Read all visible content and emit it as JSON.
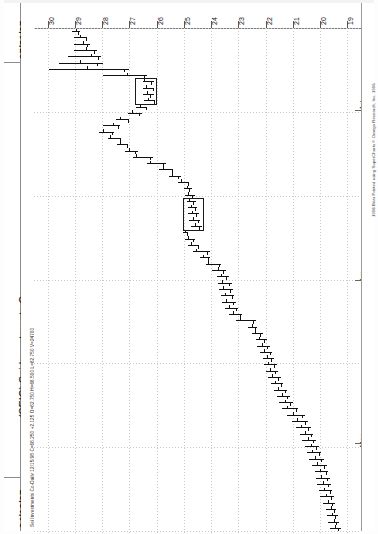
{
  "header": {
    "date_top": "07/31/97",
    "date_bottom": "04/16/97",
    "title": "(SEIC) Sei Investments Co",
    "quote_line": "Sei Investments Co-Daily  12/15/98  C=66.250  +2.125  O=62.750  H=66.500  L=62.750  V=24700",
    "copyright": "1998 Bear  Printed using SuperCharts © Omega Research, Inc. 1996"
  },
  "chart_data": {
    "type": "bar",
    "subtype": "ohlc-bar-chart-rotated",
    "title": "(SEIC) Sei Investments Co",
    "xlabel": "Date",
    "ylabel": "Price",
    "orientation": "rotated-90",
    "grid": true,
    "price_ticks": [
      30,
      29,
      28,
      27,
      26,
      25,
      24,
      23,
      22,
      21,
      20,
      19
    ],
    "ylim": [
      18.5,
      30.5
    ],
    "date_range": [
      "04/16/97",
      "07/31/97"
    ],
    "month_labels": [
      "Jul",
      "Jun",
      "May"
    ],
    "legend": [],
    "series": [
      {
        "name": "SEIC Daily OHLC",
        "bars": [
          {
            "t": 0,
            "o": 28.95,
            "h": 29.1,
            "l": 28.8,
            "c": 28.9
          },
          {
            "t": 1,
            "o": 28.8,
            "h": 29.05,
            "l": 28.55,
            "c": 28.6
          },
          {
            "t": 2,
            "o": 28.7,
            "h": 29.05,
            "l": 28.45,
            "c": 28.55
          },
          {
            "t": 3,
            "o": 28.6,
            "h": 29.05,
            "l": 28.2,
            "c": 28.3
          },
          {
            "t": 4,
            "o": 28.4,
            "h": 29.25,
            "l": 28.05,
            "c": 28.15
          },
          {
            "t": 5,
            "o": 28.8,
            "h": 29.6,
            "l": 27.95,
            "c": 28.2
          },
          {
            "t": 6,
            "o": 28.55,
            "h": 29.95,
            "l": 27.0,
            "c": 27.2
          },
          {
            "t": 7,
            "o": 27.1,
            "h": 27.95,
            "l": 26.35,
            "c": 26.45
          },
          {
            "t": 8,
            "o": 26.45,
            "h": 26.5,
            "l": 26.1,
            "c": 26.2
          },
          {
            "t": 9,
            "o": 26.4,
            "h": 26.5,
            "l": 26.1,
            "c": 26.15
          },
          {
            "t": 10,
            "o": 26.35,
            "h": 26.5,
            "l": 26.1,
            "c": 26.25
          },
          {
            "t": 11,
            "o": 26.3,
            "h": 26.45,
            "l": 26.05,
            "c": 26.1
          },
          {
            "t": 12,
            "o": 26.6,
            "h": 26.75,
            "l": 26.35,
            "c": 26.4
          },
          {
            "t": 13,
            "o": 26.9,
            "h": 27.05,
            "l": 26.55,
            "c": 26.65
          },
          {
            "t": 14,
            "o": 27.35,
            "h": 27.5,
            "l": 27.0,
            "c": 27.05
          },
          {
            "t": 15,
            "o": 27.6,
            "h": 27.95,
            "l": 27.35,
            "c": 27.4
          },
          {
            "t": 16,
            "o": 27.95,
            "h": 28.1,
            "l": 27.55,
            "c": 27.65
          },
          {
            "t": 17,
            "o": 27.7,
            "h": 27.8,
            "l": 27.3,
            "c": 27.35
          },
          {
            "t": 18,
            "o": 27.35,
            "h": 27.45,
            "l": 27.05,
            "c": 27.1
          },
          {
            "t": 19,
            "o": 27.0,
            "h": 27.15,
            "l": 26.7,
            "c": 26.8
          },
          {
            "t": 20,
            "o": 26.75,
            "h": 26.85,
            "l": 26.15,
            "c": 26.25
          },
          {
            "t": 21,
            "o": 26.25,
            "h": 26.35,
            "l": 25.65,
            "c": 25.75
          },
          {
            "t": 22,
            "o": 25.75,
            "h": 25.9,
            "l": 25.4,
            "c": 25.45
          },
          {
            "t": 23,
            "o": 25.45,
            "h": 25.55,
            "l": 25.1,
            "c": 25.2
          },
          {
            "t": 24,
            "o": 25.1,
            "h": 25.2,
            "l": 24.8,
            "c": 24.85
          },
          {
            "t": 25,
            "o": 24.9,
            "h": 25.0,
            "l": 24.7,
            "c": 24.8
          },
          {
            "t": 26,
            "o": 24.85,
            "h": 24.95,
            "l": 24.6,
            "c": 24.7
          },
          {
            "t": 27,
            "o": 24.8,
            "h": 24.9,
            "l": 24.55,
            "c": 24.65
          },
          {
            "t": 28,
            "o": 24.75,
            "h": 24.85,
            "l": 24.5,
            "c": 24.6
          },
          {
            "t": 29,
            "o": 24.7,
            "h": 24.85,
            "l": 24.45,
            "c": 24.55
          },
          {
            "t": 30,
            "o": 24.65,
            "h": 24.8,
            "l": 24.4,
            "c": 24.5
          },
          {
            "t": 31,
            "o": 24.6,
            "h": 24.75,
            "l": 24.35,
            "c": 24.45
          },
          {
            "t": 32,
            "o": 24.95,
            "h": 25.05,
            "l": 24.85,
            "c": 24.9
          },
          {
            "t": 33,
            "o": 24.85,
            "h": 24.95,
            "l": 24.6,
            "c": 24.65
          },
          {
            "t": 34,
            "o": 24.75,
            "h": 24.85,
            "l": 24.45,
            "c": 24.5
          },
          {
            "t": 35,
            "o": 24.55,
            "h": 24.65,
            "l": 24.05,
            "c": 24.15
          },
          {
            "t": 36,
            "o": 24.3,
            "h": 24.4,
            "l": 24.05,
            "c": 24.1
          },
          {
            "t": 37,
            "o": 24.1,
            "h": 24.2,
            "l": 23.65,
            "c": 23.7
          },
          {
            "t": 38,
            "o": 23.75,
            "h": 23.95,
            "l": 23.45,
            "c": 23.55
          },
          {
            "t": 39,
            "o": 23.65,
            "h": 23.8,
            "l": 23.35,
            "c": 23.45
          },
          {
            "t": 40,
            "o": 23.6,
            "h": 23.75,
            "l": 23.25,
            "c": 23.35
          },
          {
            "t": 41,
            "o": 23.55,
            "h": 23.7,
            "l": 23.2,
            "c": 23.3
          },
          {
            "t": 42,
            "o": 23.5,
            "h": 23.65,
            "l": 23.15,
            "c": 23.25
          },
          {
            "t": 43,
            "o": 23.45,
            "h": 23.6,
            "l": 23.1,
            "c": 23.2
          },
          {
            "t": 44,
            "o": 23.35,
            "h": 23.5,
            "l": 23.0,
            "c": 23.1
          },
          {
            "t": 45,
            "o": 23.2,
            "h": 23.35,
            "l": 22.85,
            "c": 22.95
          },
          {
            "t": 46,
            "o": 22.95,
            "h": 23.1,
            "l": 22.35,
            "c": 22.45
          },
          {
            "t": 47,
            "o": 22.5,
            "h": 22.65,
            "l": 22.3,
            "c": 22.4
          },
          {
            "t": 48,
            "o": 22.4,
            "h": 22.5,
            "l": 22.1,
            "c": 22.2
          },
          {
            "t": 49,
            "o": 22.25,
            "h": 22.35,
            "l": 21.95,
            "c": 22.05
          },
          {
            "t": 50,
            "o": 22.15,
            "h": 22.3,
            "l": 21.85,
            "c": 21.95
          },
          {
            "t": 51,
            "o": 22.05,
            "h": 22.2,
            "l": 21.75,
            "c": 21.85
          },
          {
            "t": 52,
            "o": 21.95,
            "h": 22.1,
            "l": 21.7,
            "c": 21.8
          },
          {
            "t": 53,
            "o": 21.9,
            "h": 22.05,
            "l": 21.6,
            "c": 21.7
          },
          {
            "t": 54,
            "o": 21.85,
            "h": 22.0,
            "l": 21.55,
            "c": 21.65
          },
          {
            "t": 55,
            "o": 21.75,
            "h": 21.9,
            "l": 21.45,
            "c": 21.55
          },
          {
            "t": 56,
            "o": 21.65,
            "h": 21.8,
            "l": 21.35,
            "c": 21.45
          },
          {
            "t": 57,
            "o": 21.55,
            "h": 21.7,
            "l": 21.2,
            "c": 21.3
          },
          {
            "t": 58,
            "o": 21.4,
            "h": 21.6,
            "l": 21.1,
            "c": 21.2
          },
          {
            "t": 59,
            "o": 21.3,
            "h": 21.5,
            "l": 21.0,
            "c": 21.1
          },
          {
            "t": 60,
            "o": 21.2,
            "h": 21.4,
            "l": 20.8,
            "c": 20.9
          },
          {
            "t": 61,
            "o": 21.0,
            "h": 21.2,
            "l": 20.55,
            "c": 20.65
          },
          {
            "t": 62,
            "o": 20.85,
            "h": 21.05,
            "l": 20.45,
            "c": 20.55
          },
          {
            "t": 63,
            "o": 20.7,
            "h": 20.9,
            "l": 20.35,
            "c": 20.45
          },
          {
            "t": 64,
            "o": 20.55,
            "h": 20.75,
            "l": 20.25,
            "c": 20.35
          },
          {
            "t": 65,
            "o": 20.45,
            "h": 20.65,
            "l": 20.15,
            "c": 20.25
          },
          {
            "t": 66,
            "o": 20.35,
            "h": 20.55,
            "l": 20.05,
            "c": 20.15
          },
          {
            "t": 67,
            "o": 20.3,
            "h": 20.5,
            "l": 19.95,
            "c": 20.05
          },
          {
            "t": 68,
            "o": 20.2,
            "h": 20.4,
            "l": 19.85,
            "c": 19.95
          },
          {
            "t": 69,
            "o": 20.1,
            "h": 20.3,
            "l": 19.75,
            "c": 19.85
          },
          {
            "t": 70,
            "o": 20.0,
            "h": 20.2,
            "l": 19.7,
            "c": 19.8
          },
          {
            "t": 71,
            "o": 19.95,
            "h": 20.15,
            "l": 19.65,
            "c": 19.75
          },
          {
            "t": 72,
            "o": 19.9,
            "h": 20.1,
            "l": 19.6,
            "c": 19.7
          },
          {
            "t": 73,
            "o": 19.85,
            "h": 20.05,
            "l": 19.55,
            "c": 19.65
          },
          {
            "t": 74,
            "o": 19.8,
            "h": 20.0,
            "l": 19.5,
            "c": 19.6
          },
          {
            "t": 75,
            "o": 19.7,
            "h": 19.9,
            "l": 19.45,
            "c": 19.55
          },
          {
            "t": 76,
            "o": 19.6,
            "h": 19.8,
            "l": 19.4,
            "c": 19.5
          },
          {
            "t": 77,
            "o": 19.55,
            "h": 19.75,
            "l": 19.35,
            "c": 19.45
          },
          {
            "t": 78,
            "o": 19.5,
            "h": 19.7,
            "l": 19.3,
            "c": 19.4
          },
          {
            "t": 79,
            "o": 19.45,
            "h": 19.65,
            "l": 19.25,
            "c": 19.35
          }
        ]
      }
    ]
  },
  "colors": {
    "bar": "#101010",
    "grid": "#c9c9c9",
    "axis": "#7d7d7d",
    "background": "#ffffff"
  }
}
